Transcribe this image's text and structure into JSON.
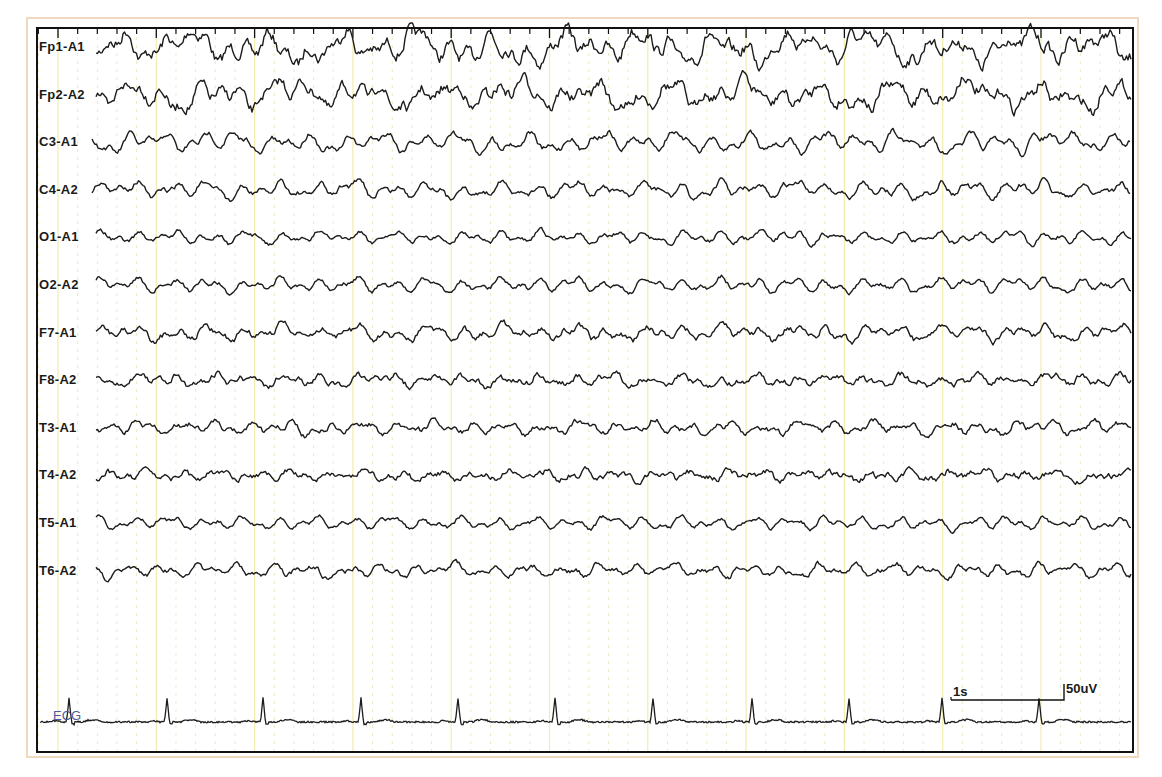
{
  "chart_data": {
    "type": "line",
    "title": "",
    "xlabel": "",
    "ylabel": "",
    "duration_seconds": 11,
    "grid": {
      "major_interval_s": 1,
      "minor_ticks_per_s": 5,
      "grid_on": true
    },
    "channels": [
      {
        "label": "Fp1-A1",
        "amp": 14,
        "slow": 1.1,
        "fast": 3.5
      },
      {
        "label": "Fp2-A2",
        "amp": 13,
        "slow": 1.0,
        "fast": 3.2
      },
      {
        "label": "C3-A1",
        "amp": 11,
        "slow": 0.6,
        "fast": 1.6
      },
      {
        "label": "C4-A2",
        "amp": 10,
        "slow": 0.5,
        "fast": 1.5
      },
      {
        "label": "O1-A1",
        "amp": 8,
        "slow": 0.3,
        "fast": 1.2
      },
      {
        "label": "O2-A2",
        "amp": 9,
        "slow": 0.4,
        "fast": 1.2
      },
      {
        "label": "F7-A1",
        "amp": 9,
        "slow": 0.6,
        "fast": 1.8
      },
      {
        "label": "F8-A2",
        "amp": 7,
        "slow": 0.5,
        "fast": 1.8
      },
      {
        "label": "T3-A1",
        "amp": 8,
        "slow": 0.5,
        "fast": 1.6
      },
      {
        "label": "T4-A2",
        "amp": 6,
        "slow": 0.5,
        "fast": 1.8
      },
      {
        "label": "T5-A1",
        "amp": 8,
        "slow": 0.3,
        "fast": 1.1
      },
      {
        "label": "T6-A2",
        "amp": 8,
        "slow": 0.4,
        "fast": 1.4
      }
    ],
    "ecg": {
      "label": "ECG",
      "r_peaks_x_px": [
        69,
        167,
        263,
        361,
        458,
        555,
        653,
        752,
        849,
        942,
        1039
      ],
      "heart_rate_approx_bpm": 60
    },
    "scale_bar": {
      "time_label": "1s",
      "amplitude_label": "50uV"
    },
    "legend": null
  },
  "labels": {
    "ecg": "ECG",
    "scale_time": "1s",
    "scale_amp": "50uV"
  },
  "colors": {
    "trace": "#1c1c1c",
    "major_grid": "#f2ecb0",
    "minor_grid": "#ece8c8",
    "frame": "#111111",
    "outer_border": "#f1d9bf",
    "ecg_label": "#4b5aa0"
  }
}
